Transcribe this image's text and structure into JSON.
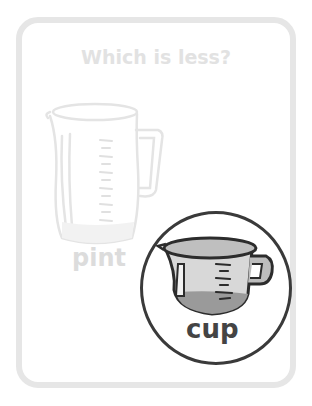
{
  "card": {
    "title": "Which is less?",
    "options": [
      {
        "label": "pint",
        "icon": "measuring-pitcher-icon",
        "selected": false,
        "color": "#dcdcdc"
      },
      {
        "label": "cup",
        "icon": "measuring-cup-icon",
        "selected": true,
        "color": "#444444"
      }
    ]
  },
  "colors": {
    "card_border": "#e6e6e6",
    "faded_text": "#e2e2e2",
    "selection_ring": "#3a3a3a"
  }
}
